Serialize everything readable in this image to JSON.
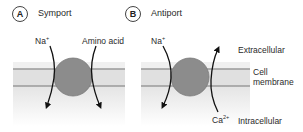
{
  "panels": [
    {
      "id": "A",
      "title": "Symport",
      "ion_left": {
        "text": "Na",
        "sup": "+"
      },
      "ion_right": {
        "text": "Amino acid",
        "sup": ""
      }
    },
    {
      "id": "B",
      "title": "Antiport",
      "ion_left": {
        "text": "Na",
        "sup": "+"
      },
      "ion_right": {
        "text": "Ca",
        "sup": "2+"
      }
    }
  ],
  "regions": {
    "extracellular": "Extracellular",
    "membrane_line1": "Cell",
    "membrane_line2": "membrane",
    "intracellular": "Intracellular"
  },
  "colors": {
    "membrane_band": "#e3e3e3",
    "membrane_line": "#9a9a9a",
    "transporter": "#8c8c8c",
    "arrow": "#111111"
  }
}
